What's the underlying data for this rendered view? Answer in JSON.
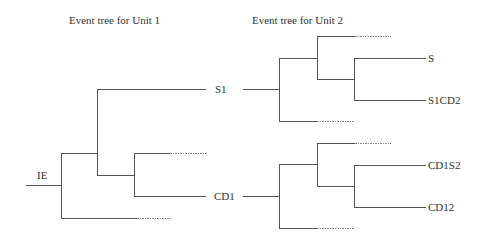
{
  "titles": {
    "unit1": "Event tree for Unit 1",
    "unit2": "Event tree for Unit 2"
  },
  "unit1": {
    "initiating_event": "IE",
    "outcomes": [
      "S1",
      "CD1"
    ]
  },
  "unit2": {
    "top_tree": {
      "input": "S1",
      "outcomes": [
        "S",
        "S1CD2"
      ]
    },
    "bottom_tree": {
      "input": "CD1",
      "outcomes": [
        "CD1S2",
        "CD12"
      ]
    }
  },
  "colors": {
    "line": "#555555",
    "dashed_line": "#777777",
    "text": "#333333"
  }
}
